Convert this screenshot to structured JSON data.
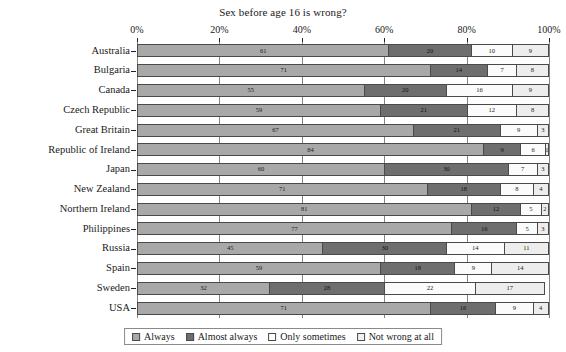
{
  "chart_data": {
    "type": "bar",
    "orientation": "horizontal",
    "stacked": true,
    "percent": true,
    "title": "Sex before age 16 is wrong?",
    "xlabel": "",
    "ylabel": "",
    "xlim": [
      0,
      100
    ],
    "grid": true,
    "legend_position": "bottom",
    "tick_labels": [
      "0%",
      "20%",
      "40%",
      "60%",
      "80%",
      "100%"
    ],
    "tick_values": [
      0,
      20,
      40,
      60,
      80,
      100
    ],
    "categories": [
      "Australia",
      "Bulgaria",
      "Canada",
      "Czech Republic",
      "Great Britain",
      "Republic of Ireland",
      "Japan",
      "New Zealand",
      "Northern Ireland",
      "Philippines",
      "Russia",
      "Spain",
      "Sweden",
      "USA"
    ],
    "series": [
      {
        "name": "Always",
        "color": "#a8a8a8",
        "values": [
          61,
          71,
          55,
          59,
          67,
          84,
          60,
          71,
          81,
          77,
          45,
          59,
          32,
          71
        ]
      },
      {
        "name": "Almost always",
        "color": "#6e6e6e",
        "values": [
          20,
          14,
          20,
          21,
          21,
          9,
          30,
          18,
          12,
          16,
          30,
          18,
          28,
          16
        ]
      },
      {
        "name": "Only sometimes",
        "color": "#fbfbfb",
        "values": [
          10,
          7,
          16,
          12,
          9,
          6,
          7,
          8,
          5,
          5,
          14,
          9,
          22,
          9
        ]
      },
      {
        "name": "Not wrong at all",
        "color": "#ededed",
        "values": [
          9,
          8,
          9,
          8,
          3,
          1,
          3,
          4,
          2,
          3,
          11,
          14,
          17,
          4
        ]
      }
    ]
  }
}
